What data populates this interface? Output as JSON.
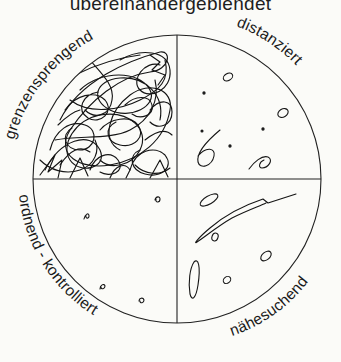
{
  "title": "übereinandergeblendet",
  "diagram": {
    "type": "quadrant-circle",
    "quadrants": [
      {
        "position": "top-left",
        "label": "grenzensprengend",
        "content": "dense overlapping scribbles"
      },
      {
        "position": "top-right",
        "label": "distanziert",
        "content": "few small scattered marks and loops"
      },
      {
        "position": "bottom-left",
        "label": "ordnend - kontrolliert",
        "content": "four tiny compact marks"
      },
      {
        "position": "bottom-right",
        "label": "nähesuchend",
        "content": "elongated loops and small ovals"
      }
    ]
  },
  "colors": {
    "ink": "#1a1a1a",
    "paper": "#fbfbf8"
  }
}
